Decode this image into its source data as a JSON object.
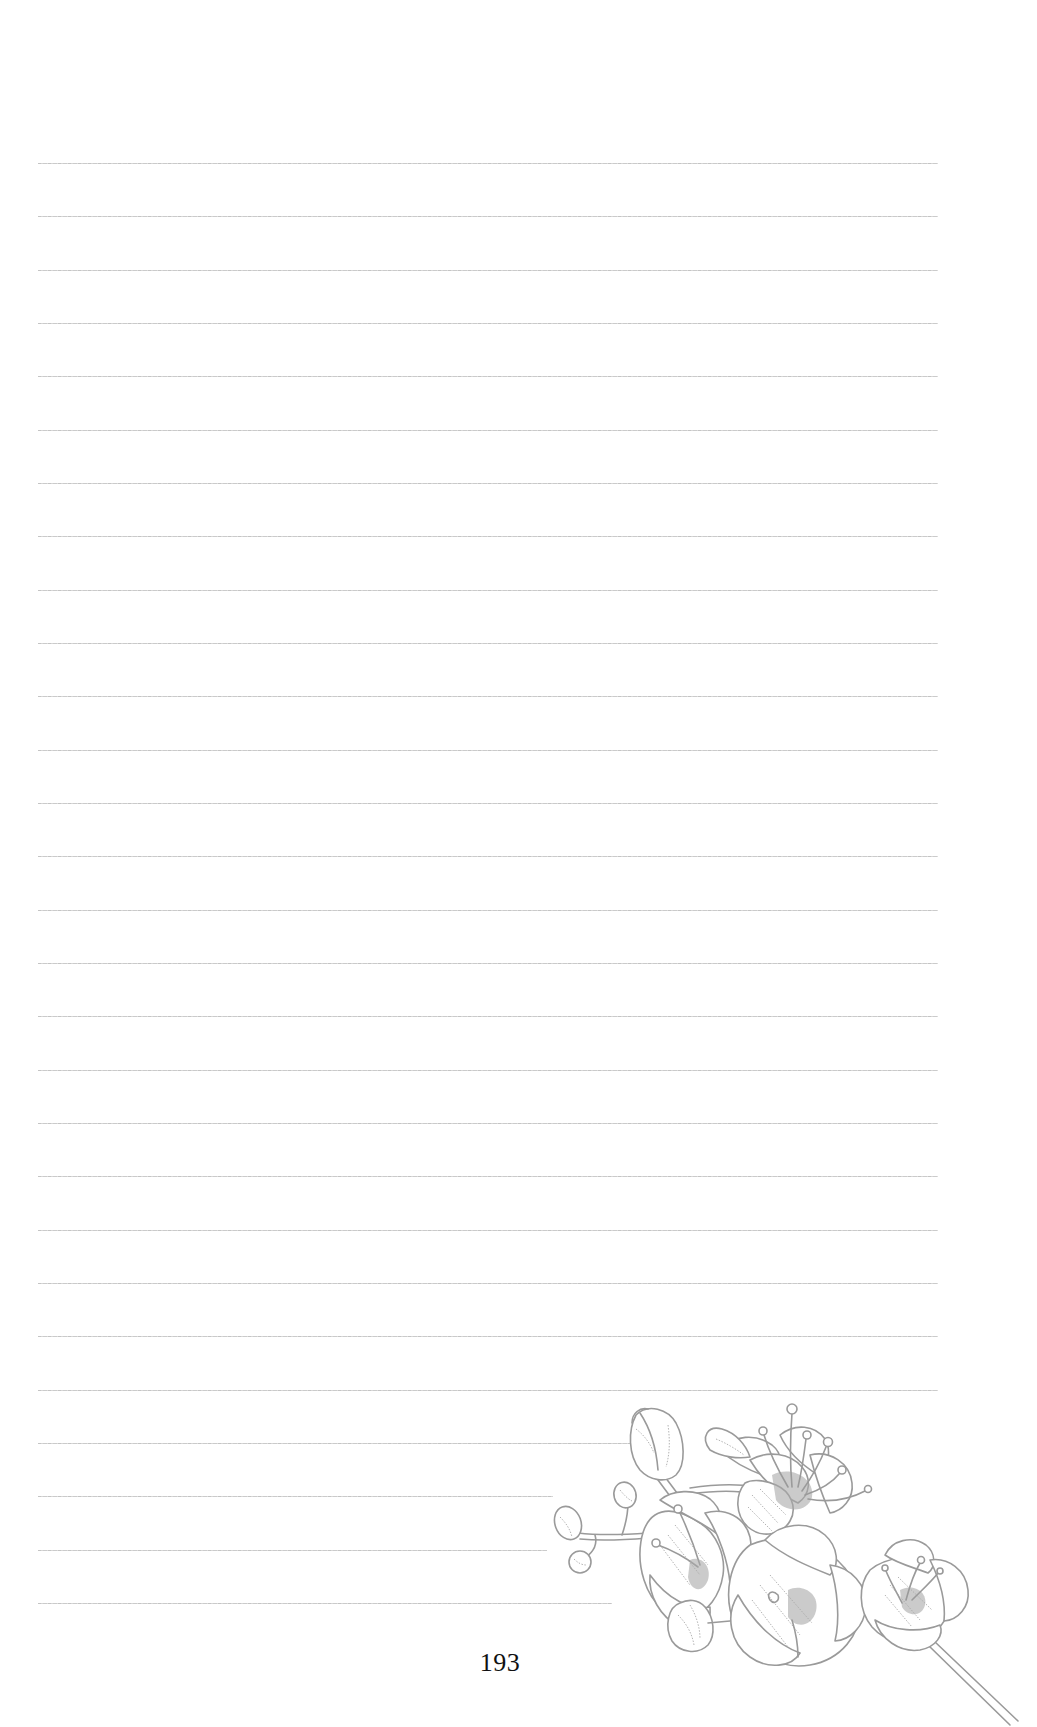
{
  "page": {
    "number": "193",
    "background": "#ffffff",
    "rule_color": "#c8c8c8",
    "illustration_color": "#9a9a9a"
  },
  "ruled_lines": {
    "count": 28,
    "left": 38,
    "first_y": 163,
    "spacing": 53.33,
    "full_right": 938,
    "short_line_ends": [
      {
        "index": 24,
        "right": 675
      },
      {
        "index": 25,
        "right": 553
      },
      {
        "index": 26,
        "right": 547
      },
      {
        "index": 27,
        "right": 612
      }
    ]
  },
  "illustration": {
    "name": "blossom-branch",
    "position": "bottom-right"
  }
}
